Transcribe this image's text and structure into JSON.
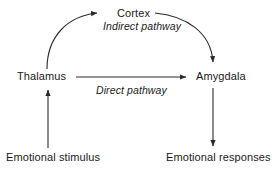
{
  "diagram": {
    "line_color": "#2b2b2b",
    "text_color": "#1a1a1a",
    "background_color": "#ffffff",
    "nodes": [
      {
        "id": "cortex",
        "label": "Cortex"
      },
      {
        "id": "thalamus",
        "label": "Thalamus"
      },
      {
        "id": "amygdala",
        "label": "Amygdala"
      },
      {
        "id": "stimulus",
        "label": "Emotional stimulus"
      },
      {
        "id": "responses",
        "label": "Emotional responses"
      }
    ],
    "edges": [
      {
        "id": "stimulus-to-thalamus",
        "from": "stimulus",
        "to": "thalamus",
        "label": "",
        "style": "straight-vertical"
      },
      {
        "id": "thalamus-to-cortex",
        "from": "thalamus",
        "to": "cortex",
        "label": "",
        "style": "curved"
      },
      {
        "id": "cortex-to-amygdala",
        "from": "cortex",
        "to": "amygdala",
        "label": "",
        "style": "curved"
      },
      {
        "id": "thalamus-to-amygdala",
        "from": "thalamus",
        "to": "amygdala",
        "label": "Direct pathway",
        "style": "straight-horizontal"
      },
      {
        "id": "amygdala-to-responses",
        "from": "amygdala",
        "to": "responses",
        "label": "",
        "style": "straight-vertical"
      }
    ],
    "edge_labels": {
      "indirect": "Indirect pathway",
      "direct": "Direct pathway"
    }
  }
}
